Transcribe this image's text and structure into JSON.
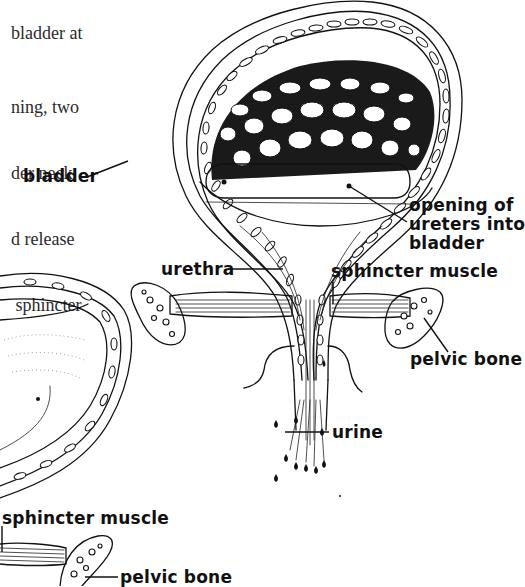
{
  "body_text": {
    "lines": [
      "bladder at",
      "",
      "ning, two",
      "der neck",
      "d release",
      " sphincter"
    ]
  },
  "labels": {
    "bladder": "bladder",
    "opening_of_ureters": [
      "opening of",
      "ureters into",
      "bladder"
    ],
    "urethra": "urethra",
    "sphincter_muscle_right": "sphincter muscle",
    "pelvic_bone_right": "pelvic bone",
    "urine": "urine",
    "sphincter_muscle_left": "sphincter muscle",
    "pelvic_bone_left": "pelvic bone"
  },
  "colors": {
    "ink": "#111111",
    "paper": "#ffffff",
    "body_text": "#2a2a2a"
  }
}
